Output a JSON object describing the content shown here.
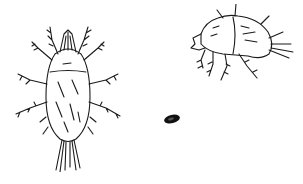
{
  "illustration": {
    "subject": "mite illustrations",
    "figures": [
      {
        "id": "dorsal-view",
        "description": "mite, dorsal view"
      },
      {
        "id": "side-view",
        "description": "mite, lateral view"
      },
      {
        "id": "actual-size",
        "description": "actual-size dot"
      }
    ],
    "colors": {
      "ink": "#1a1a1a",
      "background": "#ffffff"
    }
  }
}
